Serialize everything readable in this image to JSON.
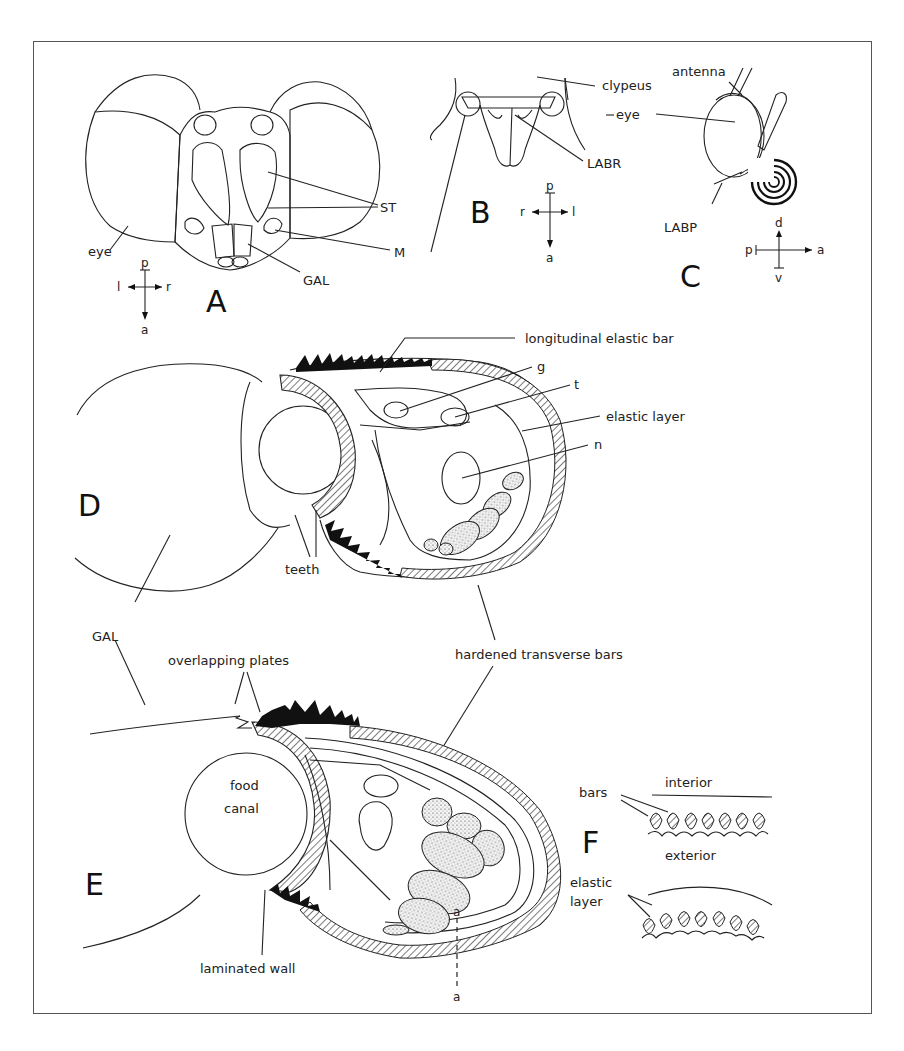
{
  "figure": {
    "panels": [
      "A",
      "B",
      "C",
      "D",
      "E",
      "F"
    ],
    "panel_A": {
      "letter": "A",
      "labels": {
        "eye": "eye",
        "st": "ST",
        "m": "M",
        "gal": "GAL"
      },
      "axes": {
        "up": "p",
        "down": "a",
        "left": "l",
        "right": "r"
      }
    },
    "panel_B": {
      "letter": "B",
      "labels": {
        "clypeus": "clypeus",
        "labr": "LABR"
      },
      "axes": {
        "up": "p",
        "down": "a",
        "left": "r",
        "right": "l"
      }
    },
    "panel_C": {
      "letter": "C",
      "labels": {
        "antenna": "antenna",
        "eye": "eye",
        "labp": "LABP"
      },
      "axes": {
        "up": "d",
        "down": "v",
        "left": "p",
        "right": "a"
      }
    },
    "panel_D": {
      "letter": "D",
      "labels": {
        "longitudinal_elastic_bar": "longitudinal elastic bar",
        "g": "g",
        "t": "t",
        "elastic_layer": "elastic layer",
        "n": "n",
        "teeth": "teeth"
      }
    },
    "shared": {
      "gal": "GAL",
      "hardened_transverse_bars": "hardened transverse bars"
    },
    "panel_E": {
      "letter": "E",
      "labels": {
        "overlapping_plates": "overlapping plates",
        "food": "food",
        "canal": "canal",
        "laminated_wall": "laminated wall",
        "section_top": "a",
        "section_bottom": "a"
      }
    },
    "panel_F": {
      "letter": "F",
      "labels": {
        "interior": "interior",
        "bars": "bars",
        "exterior": "exterior",
        "elastic": "elastic",
        "layer": "layer"
      }
    }
  }
}
